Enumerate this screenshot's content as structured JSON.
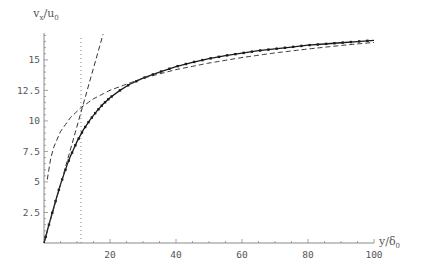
{
  "chart_data": {
    "type": "line",
    "title": "",
    "xlabel": "y/δ0",
    "ylabel": "vx/u0",
    "xlabel_parts": {
      "main": "y/δ",
      "sub": "0"
    },
    "ylabel_parts": {
      "main": "v",
      "sub1": "x",
      "mid": "/u",
      "sub2": "0"
    },
    "xlim": [
      0,
      100
    ],
    "ylim": [
      0,
      17.2
    ],
    "x_ticks": [
      20,
      40,
      60,
      80,
      100
    ],
    "x_tick_labels": [
      "20",
      "40",
      "60",
      "80",
      "100"
    ],
    "y_ticks": [
      2.5,
      5,
      7.5,
      10,
      12.5,
      15
    ],
    "y_tick_labels": [
      "2.5",
      "5",
      "7.5",
      "10",
      "12.5",
      "15"
    ],
    "grid": false,
    "legend": null,
    "annotations": [
      {
        "type": "vertical-dotted-line",
        "x": 11.2,
        "note": "edge of viscous sublayer"
      }
    ],
    "series": [
      {
        "name": "velocity profile (solid with markers)",
        "style": "solid-markers",
        "x": [
          0,
          1,
          2,
          3,
          4,
          5,
          6,
          7,
          8,
          9,
          10,
          12,
          14,
          16,
          18,
          20,
          23,
          26,
          30,
          35,
          40,
          45,
          50,
          55,
          60,
          65,
          70,
          75,
          80,
          85,
          90,
          95,
          100
        ],
        "values": [
          0,
          1.0,
          2.0,
          2.95,
          3.9,
          4.8,
          5.6,
          6.4,
          7.1,
          7.7,
          8.3,
          9.3,
          10.1,
          10.8,
          11.4,
          11.9,
          12.5,
          13.0,
          13.5,
          14.0,
          14.45,
          14.8,
          15.1,
          15.35,
          15.55,
          15.75,
          15.9,
          16.05,
          16.2,
          16.3,
          16.4,
          16.5,
          16.6
        ]
      },
      {
        "name": "linear law v = y (dashed)",
        "style": "dashed",
        "x": [
          0,
          17.9
        ],
        "values": [
          0,
          17.1
        ]
      },
      {
        "name": "log law v = 2.44 ln y + 5.2 (dashed)",
        "style": "dashed",
        "x": [
          1,
          2,
          3,
          5,
          8,
          11.2,
          15,
          20,
          30,
          40,
          50,
          60,
          70,
          80,
          90,
          100
        ],
        "values": [
          5.2,
          6.89,
          7.88,
          9.13,
          10.27,
          11.09,
          11.81,
          12.51,
          13.5,
          14.2,
          14.74,
          15.19,
          15.57,
          15.89,
          16.18,
          16.43
        ]
      }
    ]
  },
  "colors": {
    "axis": "#8a8a8a",
    "curve": "#1a1a1a",
    "dashed": "#333333",
    "dotted": "#888888",
    "label": "#555555"
  }
}
